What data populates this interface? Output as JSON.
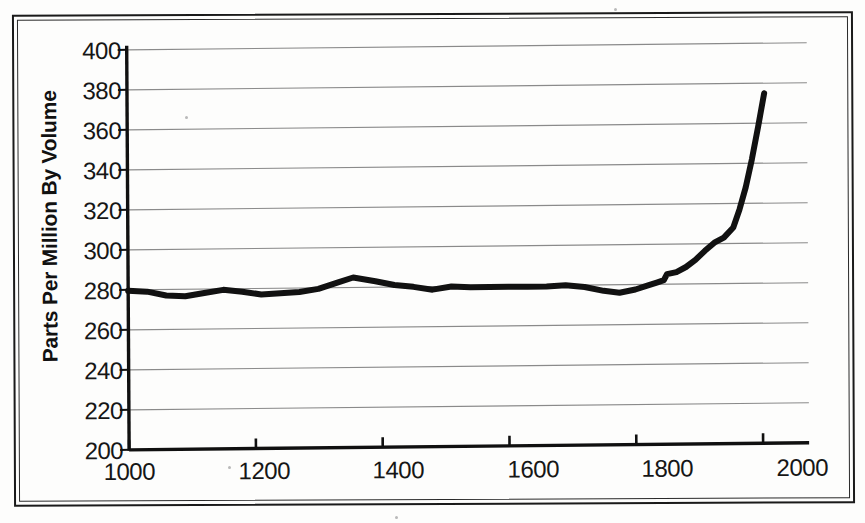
{
  "figure": {
    "kind": "scanned-line-chart",
    "background_color": "#fdfdfc",
    "ink_color": "#111111",
    "gridline_color": "#8a8a8a"
  },
  "axis_titles": {
    "y": "Parts Per Million By Volume",
    "x": ""
  },
  "y_ticks": [
    "400",
    "380",
    "360",
    "340",
    "320",
    "300",
    "280",
    "260",
    "240",
    "220",
    "200"
  ],
  "x_ticks": [
    "1000",
    "1200",
    "1400",
    "1600",
    "1800",
    "2000"
  ],
  "chart_data": {
    "type": "line",
    "title": "",
    "xlabel": "",
    "ylabel": "Parts Per Million By Volume",
    "xlim": [
      1000,
      2010
    ],
    "ylim": [
      200,
      400
    ],
    "xticks": [
      1000,
      1200,
      1400,
      1600,
      1800,
      2000
    ],
    "yticks": [
      200,
      220,
      240,
      260,
      280,
      300,
      320,
      340,
      360,
      380,
      400
    ],
    "grid": "horizontal",
    "legend": "none",
    "line_color": "#111111",
    "line_width_px": 6,
    "series": [
      {
        "name": "Atmospheric concentration",
        "x": [
          1000,
          1030,
          1060,
          1090,
          1120,
          1150,
          1180,
          1210,
          1240,
          1270,
          1300,
          1330,
          1355,
          1390,
          1420,
          1450,
          1480,
          1510,
          1540,
          1570,
          1600,
          1630,
          1660,
          1690,
          1720,
          1750,
          1775,
          1800,
          1820,
          1835,
          1845,
          1850,
          1865,
          1880,
          1895,
          1910,
          1925,
          1940,
          1955,
          1965,
          1975,
          1985,
          1995,
          2005
        ],
        "y": [
          279.5,
          279.0,
          277.0,
          276.5,
          278.0,
          279.5,
          278.5,
          277.0,
          277.5,
          278.0,
          279.5,
          282.5,
          285.0,
          283.0,
          281.0,
          280.0,
          278.5,
          280.0,
          279.5,
          279.5,
          279.5,
          279.5,
          279.5,
          280.0,
          279.0,
          277.0,
          276.0,
          277.5,
          279.5,
          281.0,
          282.0,
          285.0,
          286.0,
          288.5,
          292.0,
          296.5,
          300.5,
          303.0,
          308.0,
          317.0,
          328.0,
          342.0,
          358.0,
          375.0
        ]
      }
    ]
  },
  "annotations": []
}
